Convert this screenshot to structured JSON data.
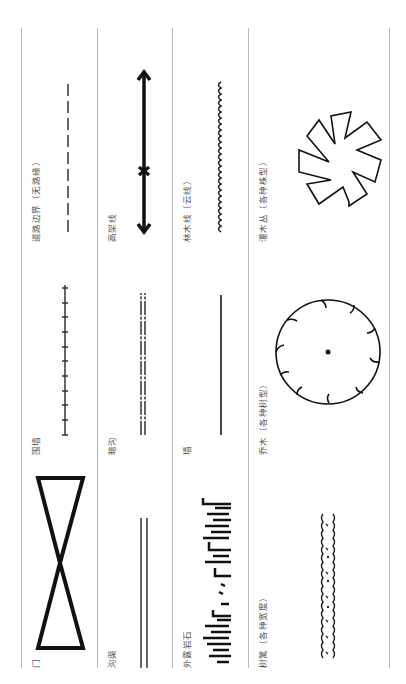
{
  "legend": {
    "rows": [
      {
        "cells": [
          {
            "label": "门",
            "symbol": "gate-bowtie-icon"
          },
          {
            "label": "围墙",
            "symbol": "fence-ticked-line-icon"
          },
          {
            "label": "道路边界（无路缘）",
            "symbol": "road-edge-dashed-line-icon"
          }
        ]
      },
      {
        "cells": [
          {
            "label": "沟渠",
            "symbol": "ditch-double-line-icon"
          },
          {
            "label": "暗沟",
            "symbol": "culvert-dashed-double-line-icon"
          },
          {
            "label": "高架线",
            "symbol": "overhead-line-arrow-icon"
          }
        ]
      },
      {
        "cells": [
          {
            "label": "外露岩石",
            "symbol": "rock-outcrop-icon"
          },
          {
            "label": "墙",
            "symbol": "wall-line-icon"
          },
          {
            "label": "林木线（云线）",
            "symbol": "tree-line-scalloped-icon"
          }
        ]
      },
      {
        "cells": [
          {
            "label": "树篱（各种宽度）",
            "symbol": "hedge-icon"
          },
          {
            "label": "乔木（各种树型）",
            "symbol": "tree-canopy-circle-icon"
          },
          {
            "label": "灌木丛（各种株型）",
            "symbol": "shrub-star-icon"
          }
        ]
      }
    ]
  },
  "colors": {
    "line": "#b8b8b8",
    "symbol": "#111111",
    "label": "#555555"
  }
}
